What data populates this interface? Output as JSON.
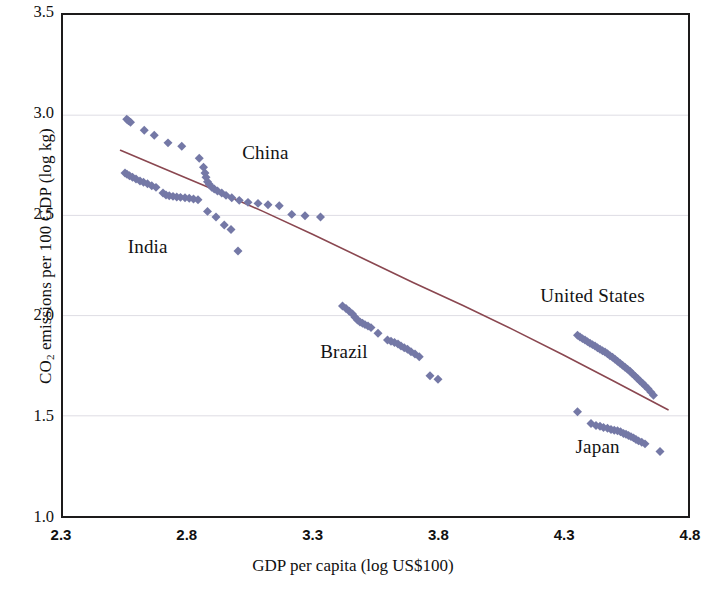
{
  "chart_data": {
    "type": "scatter",
    "title": "",
    "xlabel": "GDP per capita (log US$100)",
    "ylabel": "CO2 emissions per 100 GDP (log kg)",
    "ylabel_parts": {
      "pre": "CO",
      "sub": "2",
      "post": " emissions per 100 GDP (log kg)"
    },
    "xlim": [
      2.3,
      4.8
    ],
    "ylim": [
      1.0,
      3.5
    ],
    "xticks": [
      "2.3",
      "2.8",
      "3.3",
      "3.8",
      "4.3",
      "4.8"
    ],
    "yticks": [
      "1.0",
      "1.5",
      "2.0",
      "2.5",
      "3.0",
      "3.5"
    ],
    "xtick_values": [
      2.3,
      2.8,
      3.3,
      3.8,
      4.3,
      4.8
    ],
    "ytick_values": [
      1.0,
      1.5,
      2.0,
      2.5,
      3.0,
      3.5
    ],
    "grid": "horizontal-faint",
    "legend": "none",
    "marker": {
      "shape": "diamond",
      "color": "#7478a6",
      "size": 9
    },
    "trendline": {
      "name": "fitted trend",
      "color": "#8a4750",
      "width": 1.6,
      "points": [
        [
          2.53,
          2.825
        ],
        [
          2.7,
          2.735
        ],
        [
          2.9,
          2.63
        ],
        [
          3.1,
          2.52
        ],
        [
          3.3,
          2.405
        ],
        [
          3.5,
          2.285
        ],
        [
          3.7,
          2.165
        ],
        [
          3.9,
          2.05
        ],
        [
          4.1,
          1.93
        ],
        [
          4.3,
          1.805
        ],
        [
          4.5,
          1.675
        ],
        [
          4.72,
          1.53
        ]
      ]
    },
    "series": [
      {
        "name": "China",
        "label": "China",
        "label_xy": [
          3.02,
          2.8
        ],
        "points": [
          [
            2.555,
            2.98
          ],
          [
            2.562,
            2.972
          ],
          [
            2.57,
            2.965
          ],
          [
            2.625,
            2.925
          ],
          [
            2.665,
            2.9
          ],
          [
            2.72,
            2.862
          ],
          [
            2.775,
            2.845
          ],
          [
            2.845,
            2.785
          ],
          [
            2.862,
            2.74
          ],
          [
            2.868,
            2.712
          ],
          [
            2.872,
            2.69
          ],
          [
            2.878,
            2.668
          ],
          [
            2.885,
            2.655
          ],
          [
            2.895,
            2.64
          ],
          [
            2.905,
            2.632
          ],
          [
            2.918,
            2.622
          ],
          [
            2.935,
            2.612
          ],
          [
            2.952,
            2.6
          ],
          [
            2.975,
            2.588
          ],
          [
            3.005,
            2.575
          ],
          [
            3.04,
            2.565
          ],
          [
            3.08,
            2.56
          ],
          [
            3.12,
            2.553
          ],
          [
            3.165,
            2.548
          ],
          [
            3.215,
            2.505
          ],
          [
            3.268,
            2.498
          ],
          [
            3.33,
            2.492
          ]
        ]
      },
      {
        "name": "India",
        "label": "India",
        "label_xy": [
          2.565,
          2.335
        ],
        "points": [
          [
            2.548,
            2.712
          ],
          [
            2.556,
            2.705
          ],
          [
            2.566,
            2.698
          ],
          [
            2.578,
            2.69
          ],
          [
            2.592,
            2.682
          ],
          [
            2.608,
            2.672
          ],
          [
            2.622,
            2.665
          ],
          [
            2.638,
            2.658
          ],
          [
            2.655,
            2.648
          ],
          [
            2.672,
            2.64
          ],
          [
            2.7,
            2.612
          ],
          [
            2.712,
            2.602
          ],
          [
            2.725,
            2.598
          ],
          [
            2.74,
            2.595
          ],
          [
            2.755,
            2.592
          ],
          [
            2.77,
            2.59
          ],
          [
            2.788,
            2.588
          ],
          [
            2.805,
            2.586
          ],
          [
            2.822,
            2.582
          ],
          [
            2.84,
            2.578
          ],
          [
            2.878,
            2.52
          ],
          [
            2.912,
            2.492
          ],
          [
            2.945,
            2.452
          ],
          [
            2.972,
            2.43
          ],
          [
            3.0,
            2.322
          ]
        ]
      },
      {
        "name": "Brazil",
        "label": "Brazil",
        "label_xy": [
          3.33,
          1.815
        ],
        "points": [
          [
            3.418,
            2.048
          ],
          [
            3.432,
            2.035
          ],
          [
            3.445,
            2.022
          ],
          [
            3.458,
            2.008
          ],
          [
            3.468,
            1.992
          ],
          [
            3.478,
            1.978
          ],
          [
            3.488,
            1.968
          ],
          [
            3.498,
            1.962
          ],
          [
            3.508,
            1.955
          ],
          [
            3.52,
            1.948
          ],
          [
            3.532,
            1.94
          ],
          [
            3.56,
            1.912
          ],
          [
            3.598,
            1.878
          ],
          [
            3.612,
            1.872
          ],
          [
            3.626,
            1.866
          ],
          [
            3.64,
            1.858
          ],
          [
            3.652,
            1.848
          ],
          [
            3.665,
            1.84
          ],
          [
            3.678,
            1.832
          ],
          [
            3.692,
            1.82
          ],
          [
            3.708,
            1.808
          ],
          [
            3.725,
            1.795
          ],
          [
            3.768,
            1.7
          ],
          [
            3.8,
            1.682
          ]
        ]
      },
      {
        "name": "United States",
        "label": "United States",
        "label_xy": [
          4.205,
          2.095
        ],
        "points": [
          [
            4.358,
            1.902
          ],
          [
            4.368,
            1.893
          ],
          [
            4.378,
            1.885
          ],
          [
            4.388,
            1.878
          ],
          [
            4.398,
            1.87
          ],
          [
            4.408,
            1.862
          ],
          [
            4.418,
            1.855
          ],
          [
            4.428,
            1.848
          ],
          [
            4.438,
            1.84
          ],
          [
            4.448,
            1.832
          ],
          [
            4.458,
            1.825
          ],
          [
            4.468,
            1.818
          ],
          [
            4.478,
            1.81
          ],
          [
            4.488,
            1.8
          ],
          [
            4.498,
            1.792
          ],
          [
            4.508,
            1.782
          ],
          [
            4.518,
            1.772
          ],
          [
            4.528,
            1.762
          ],
          [
            4.538,
            1.752
          ],
          [
            4.548,
            1.742
          ],
          [
            4.558,
            1.732
          ],
          [
            4.568,
            1.722
          ],
          [
            4.578,
            1.71
          ],
          [
            4.588,
            1.698
          ],
          [
            4.598,
            1.686
          ],
          [
            4.608,
            1.674
          ],
          [
            4.618,
            1.662
          ],
          [
            4.628,
            1.65
          ],
          [
            4.64,
            1.635
          ],
          [
            4.652,
            1.618
          ],
          [
            4.662,
            1.602
          ]
        ]
      },
      {
        "name": "Japan",
        "label": "Japan",
        "label_xy": [
          4.345,
          1.345
        ],
        "points": [
          [
            4.358,
            1.52
          ],
          [
            4.412,
            1.462
          ],
          [
            4.432,
            1.452
          ],
          [
            4.448,
            1.448
          ],
          [
            4.462,
            1.442
          ],
          [
            4.478,
            1.438
          ],
          [
            4.492,
            1.432
          ],
          [
            4.505,
            1.428
          ],
          [
            4.518,
            1.425
          ],
          [
            4.53,
            1.42
          ],
          [
            4.542,
            1.412
          ],
          [
            4.552,
            1.408
          ],
          [
            4.562,
            1.402
          ],
          [
            4.572,
            1.396
          ],
          [
            4.582,
            1.39
          ],
          [
            4.592,
            1.382
          ],
          [
            4.602,
            1.375
          ],
          [
            4.615,
            1.368
          ],
          [
            4.628,
            1.36
          ],
          [
            4.688,
            1.322
          ]
        ]
      }
    ]
  }
}
